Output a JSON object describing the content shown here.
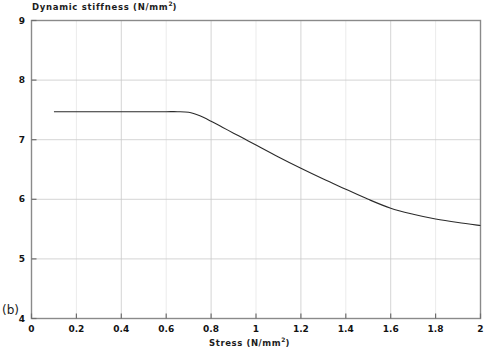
{
  "panel": {
    "label": "(b)"
  },
  "chart_data": {
    "type": "line",
    "title_text": "Dynamic stiffness (N/mm",
    "title_sup": "2",
    "title_tail": ")",
    "xlabel_text": "Stress (N/mm",
    "xlabel_sup": "2",
    "xlabel_tail": ")",
    "xlabel": "Stress (N/mm²)",
    "ylabel": "Dynamic stiffness (N/mm²)",
    "xlim": [
      0,
      2
    ],
    "ylim": [
      4,
      9
    ],
    "xticks": [
      0,
      0.2,
      0.4,
      0.6,
      0.8,
      1,
      1.2,
      1.4,
      1.6,
      1.8,
      2
    ],
    "xtick_labels": [
      "0",
      "0.2",
      "0.4",
      "0.6",
      "0.8",
      "1",
      "1.2",
      "1.4",
      "1.6",
      "1.8",
      "2"
    ],
    "yticks": [
      4,
      5,
      6,
      7,
      8,
      9
    ],
    "ytick_labels": [
      "4",
      "5",
      "6",
      "7",
      "8",
      "9"
    ],
    "grid": true,
    "grid_color": "#dcdcdc",
    "legend": null,
    "line_color": "#2b2b2b",
    "series": [
      {
        "name": "Dynamic stiffness vs stress",
        "x": [
          0.1,
          0.2,
          0.3,
          0.4,
          0.5,
          0.6,
          0.65,
          0.7,
          0.75,
          0.8,
          0.85,
          0.9,
          0.95,
          1.0,
          1.1,
          1.2,
          1.3,
          1.4,
          1.5,
          1.6,
          1.7,
          1.8,
          1.9,
          2.0
        ],
        "values": [
          7.47,
          7.47,
          7.47,
          7.47,
          7.47,
          7.47,
          7.47,
          7.46,
          7.4,
          7.31,
          7.21,
          7.11,
          7.01,
          6.91,
          6.71,
          6.52,
          6.34,
          6.17,
          6.0,
          5.85,
          5.75,
          5.67,
          5.61,
          5.56
        ]
      }
    ]
  },
  "ticks": {
    "y": [
      {
        "label": "9",
        "value": 9
      },
      {
        "label": "8",
        "value": 8
      },
      {
        "label": "7",
        "value": 7
      },
      {
        "label": "6",
        "value": 6
      },
      {
        "label": "5",
        "value": 5
      },
      {
        "label": "4",
        "value": 4
      }
    ],
    "x": [
      {
        "label": "0",
        "value": 0
      },
      {
        "label": "0.2",
        "value": 0.2
      },
      {
        "label": "0.4",
        "value": 0.4
      },
      {
        "label": "0.6",
        "value": 0.6
      },
      {
        "label": "0.8",
        "value": 0.8
      },
      {
        "label": "1",
        "value": 1
      },
      {
        "label": "1.2",
        "value": 1.2
      },
      {
        "label": "1.4",
        "value": 1.4
      },
      {
        "label": "1.6",
        "value": 1.6
      },
      {
        "label": "1.8",
        "value": 1.8
      },
      {
        "label": "2",
        "value": 2
      }
    ]
  }
}
